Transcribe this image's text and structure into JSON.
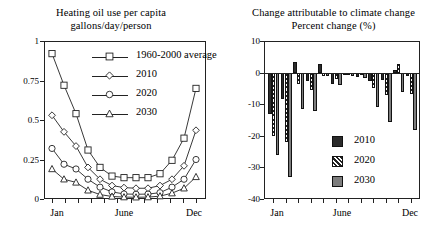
{
  "left_chart": {
    "title_line1": "Heating oil use per capita",
    "title_line2": "gallons/day/person",
    "y_ticks": [
      "1",
      "0.75",
      "0.5",
      "0.25",
      "0"
    ],
    "x_labels": [
      "Jan",
      "June",
      "Dec"
    ],
    "legend": [
      {
        "label": "1960-2000 average",
        "marker": "square"
      },
      {
        "label": "2010",
        "marker": "diamond"
      },
      {
        "label": "2020",
        "marker": "circle"
      },
      {
        "label": "2030",
        "marker": "triangle"
      }
    ]
  },
  "right_chart": {
    "title_line1": "Change attributable to climate change",
    "title_line2": "Percent change (%)",
    "y_ticks": [
      "10",
      "0",
      "-10",
      "-20",
      "-30",
      "-40"
    ],
    "x_labels": [
      "Jan",
      "June",
      "Dec"
    ],
    "legend": [
      {
        "label": "2010",
        "swatch": "solid-black"
      },
      {
        "label": "2020",
        "swatch": "diagonal-hatch"
      },
      {
        "label": "2030",
        "swatch": "solid-gray"
      }
    ]
  },
  "chart_data": [
    {
      "type": "line",
      "title": "Heating oil use per capita gallons/day/person",
      "xlabel": "",
      "ylabel": "gallons/day/person",
      "ylim": [
        0,
        1
      ],
      "yticks": [
        0,
        0.25,
        0.5,
        0.75,
        1
      ],
      "grid": false,
      "legend_position": "inside-top-right",
      "categories": [
        "Jan",
        "Feb",
        "Mar",
        "Apr",
        "May",
        "June",
        "Jul",
        "Aug",
        "Sep",
        "Oct",
        "Nov",
        "Dec"
      ],
      "series": [
        {
          "name": "1960-2000 average",
          "marker": "square",
          "values": [
            0.92,
            0.72,
            0.54,
            0.31,
            0.2,
            0.145,
            0.135,
            0.135,
            0.135,
            0.16,
            0.245,
            0.385,
            0.7
          ]
        },
        {
          "name": "2010",
          "marker": "diamond",
          "values": [
            0.53,
            0.425,
            0.335,
            0.2,
            0.125,
            0.085,
            0.072,
            0.068,
            0.068,
            0.085,
            0.125,
            0.21,
            0.435
          ]
        },
        {
          "name": "2020",
          "marker": "circle",
          "values": [
            0.32,
            0.22,
            0.19,
            0.125,
            0.075,
            0.045,
            0.032,
            0.03,
            0.031,
            0.04,
            0.075,
            0.125,
            0.25
          ]
        },
        {
          "name": "2030",
          "marker": "triangle",
          "values": [
            0.19,
            0.125,
            0.105,
            0.055,
            0.028,
            0.016,
            0.012,
            0.011,
            0.012,
            0.018,
            0.037,
            0.068,
            0.14
          ]
        }
      ],
      "note": "Series carry 13 plotted points spanning Jan through Dec."
    },
    {
      "type": "bar",
      "title": "Change attributable to climate change Percent change (%)",
      "xlabel": "",
      "ylabel": "Percent change (%)",
      "ylim": [
        -40,
        10
      ],
      "yticks": [
        10,
        0,
        -10,
        -20,
        -30,
        -40
      ],
      "grid": false,
      "legend_position": "inside-bottom-right",
      "categories": [
        "Jan",
        "Feb",
        "Mar",
        "Apr",
        "May",
        "June",
        "Jul",
        "Aug",
        "Sep",
        "Oct",
        "Nov",
        "Dec"
      ],
      "series": [
        {
          "name": "2010",
          "values": [
            -13.0,
            -8.5,
            3.2,
            -2.6,
            2.6,
            -3.5,
            -0.6,
            -1.4,
            -2.6,
            -2.3,
            0.9,
            -1.2
          ]
        },
        {
          "name": "2020",
          "values": [
            -20.0,
            -22.0,
            -3.5,
            -5.5,
            -1.2,
            -2.0,
            -0.5,
            -0.9,
            -5.0,
            -7.0,
            2.6,
            -6.8
          ]
        },
        {
          "name": "2030",
          "values": [
            -26.0,
            -33.0,
            -11.5,
            -12.0,
            -1.0,
            -4.0,
            -1.0,
            -1.8,
            -10.8,
            -15.5,
            -6.0,
            -18.2
          ]
        }
      ]
    }
  ]
}
